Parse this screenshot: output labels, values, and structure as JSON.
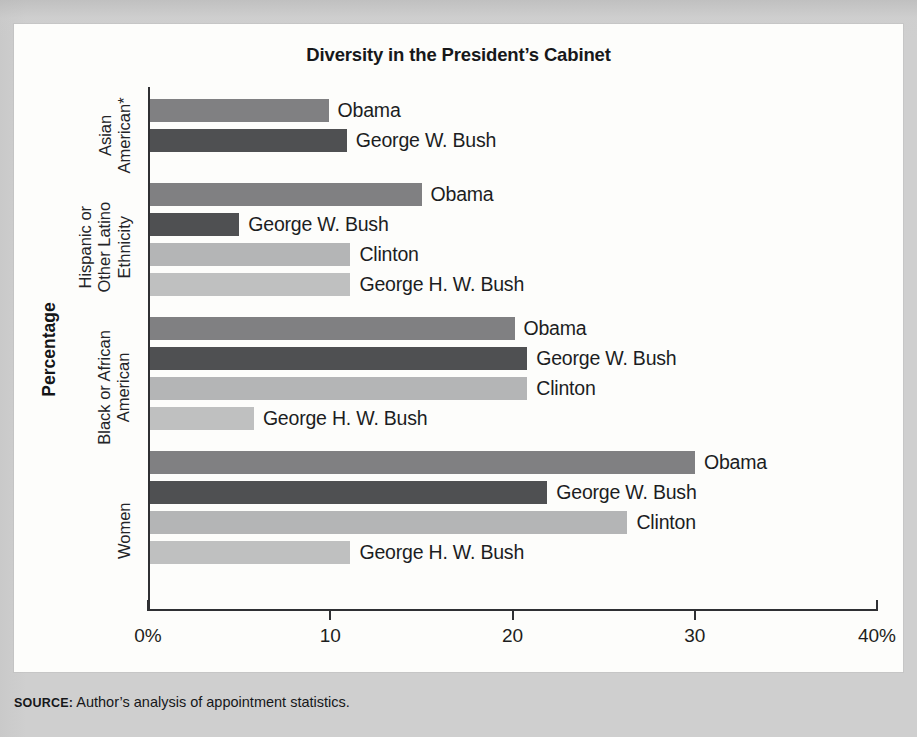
{
  "figure": {
    "title": "Diversity in the President’s Cabinet",
    "source_tag": "SOURCE:",
    "source_text": " Author’s analysis of appointment statistics."
  },
  "chart_data": {
    "type": "bar",
    "orientation": "horizontal",
    "title": "Diversity in the President’s Cabinet",
    "xlabel": "Percentage",
    "ylabel": "",
    "xlim": [
      0,
      40
    ],
    "xtick_labels": [
      "0%",
      "10",
      "20",
      "30",
      "40%"
    ],
    "xtick_values": [
      0,
      10,
      20,
      30,
      40
    ],
    "grid": false,
    "legend": "inline-labels",
    "value_unit": "%",
    "colors": {
      "Obama": "#808082",
      "George W. Bush": "#4f5052",
      "Clinton": "#b4b5b6",
      "George H. W. Bush": "#bfc0c0"
    },
    "groups": [
      {
        "category": "Asian American*",
        "category_lines": [
          "Asian",
          "American*"
        ],
        "bars": [
          {
            "name": "Obama",
            "label": "Obama",
            "value": 9.8
          },
          {
            "name": "George W. Bush",
            "label": "George W. Bush",
            "value": 10.8
          }
        ]
      },
      {
        "category": "Hispanic or Other Latino Ethnicity",
        "category_lines": [
          "Hispanic or",
          "Other Latino",
          "Ethnicity"
        ],
        "bars": [
          {
            "name": "Obama",
            "label": "Obama",
            "value": 14.9
          },
          {
            "name": "George W. Bush",
            "label": "George W. Bush",
            "value": 4.9
          },
          {
            "name": "Clinton",
            "label": "Clinton",
            "value": 11.0
          },
          {
            "name": "George H. W. Bush",
            "label": "George H. W. Bush",
            "value": 11.0
          }
        ]
      },
      {
        "category": "Black or African American",
        "category_lines": [
          "Black or African",
          "American"
        ],
        "bars": [
          {
            "name": "Obama",
            "label": "Obama",
            "value": 20.0
          },
          {
            "name": "George W. Bush",
            "label": "George W. Bush",
            "value": 20.7
          },
          {
            "name": "Clinton",
            "label": "Clinton",
            "value": 20.7
          },
          {
            "name": "George H. W. Bush",
            "label": "George H. W. Bush",
            "value": 5.7
          }
        ]
      },
      {
        "category": "Women",
        "category_lines": [
          "Women"
        ],
        "bars": [
          {
            "name": "Obama",
            "label": "Obama",
            "value": 29.9
          },
          {
            "name": "George W. Bush",
            "label": "George W. Bush",
            "value": 21.8
          },
          {
            "name": "Clinton",
            "label": "Clinton",
            "value": 26.2
          },
          {
            "name": "George H. W. Bush",
            "label": "George H. W. Bush",
            "value": 11.0
          }
        ]
      }
    ]
  },
  "layout": {
    "plot_width_px": 729,
    "plot_height_px": 524,
    "bar_height_px": 23,
    "bar_gap_px": 7,
    "group_gap_px": 18,
    "group_tops_px": [
      12,
      96,
      230,
      364
    ],
    "category_label_centers_px": [
      48,
      160,
      300,
      443
    ],
    "axis_title_center_px": 262
  }
}
